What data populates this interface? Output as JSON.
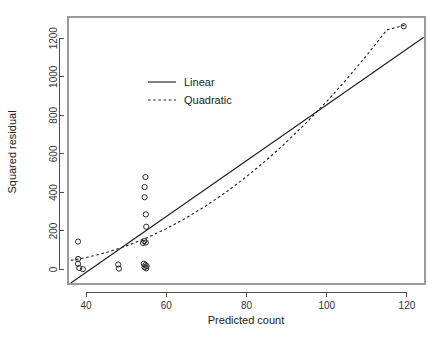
{
  "chart_data": {
    "type": "scatter",
    "title": "",
    "xlabel": "Predicted count",
    "ylabel": "Squared residual",
    "xlim": [
      35.5,
      124.5
    ],
    "ylim": [
      -75,
      1310
    ],
    "grid": false,
    "xticks": [
      40,
      60,
      80,
      100,
      120
    ],
    "yticks": [
      0,
      200,
      400,
      600,
      800,
      1000,
      1200
    ],
    "xtick_labels": [
      "40",
      "60",
      "80",
      "100",
      "120"
    ],
    "ytick_labels": [
      "0",
      "200",
      "400",
      "600",
      "800",
      "1000",
      "1200"
    ],
    "legend_position": "upper-left-inset",
    "point_marker": "open-circle",
    "point_color": "#2b2b2b",
    "line_color": "#1c1c1c",
    "points": [
      {
        "x": 38.0,
        "y": 145
      },
      {
        "x": 38.0,
        "y": 55
      },
      {
        "x": 38.0,
        "y": 30
      },
      {
        "x": 38.3,
        "y": 8
      },
      {
        "x": 39.2,
        "y": 2
      },
      {
        "x": 48.0,
        "y": 26
      },
      {
        "x": 48.2,
        "y": 5
      },
      {
        "x": 54.8,
        "y": 480
      },
      {
        "x": 54.6,
        "y": 428
      },
      {
        "x": 54.6,
        "y": 375
      },
      {
        "x": 54.9,
        "y": 286
      },
      {
        "x": 55.0,
        "y": 222
      },
      {
        "x": 54.5,
        "y": 148
      },
      {
        "x": 54.9,
        "y": 140
      },
      {
        "x": 54.2,
        "y": 138
      },
      {
        "x": 54.4,
        "y": 30
      },
      {
        "x": 54.8,
        "y": 24
      },
      {
        "x": 55.1,
        "y": 18
      },
      {
        "x": 54.6,
        "y": 12
      },
      {
        "x": 55.0,
        "y": 6
      },
      {
        "x": 119.2,
        "y": 1262
      }
    ],
    "series": [
      {
        "name": "Linear",
        "type": "line",
        "style": "solid",
        "model": "y = a + b*x",
        "endpoints": [
          {
            "x": 36.2,
            "y": -70
          },
          {
            "x": 124.2,
            "y": 1205
          }
        ]
      },
      {
        "name": "Quadratic",
        "type": "line",
        "style": "dashed",
        "model": "y = a + b*x + c*x^2",
        "sample_points": [
          {
            "x": 36.2,
            "y": 48
          },
          {
            "x": 40.0,
            "y": 62
          },
          {
            "x": 45.0,
            "y": 88
          },
          {
            "x": 50.0,
            "y": 122
          },
          {
            "x": 55.0,
            "y": 163
          },
          {
            "x": 60.0,
            "y": 212
          },
          {
            "x": 65.0,
            "y": 268
          },
          {
            "x": 70.0,
            "y": 332
          },
          {
            "x": 75.0,
            "y": 403
          },
          {
            "x": 80.0,
            "y": 482
          },
          {
            "x": 85.0,
            "y": 568
          },
          {
            "x": 90.0,
            "y": 662
          },
          {
            "x": 95.0,
            "y": 763
          },
          {
            "x": 100.0,
            "y": 872
          },
          {
            "x": 105.0,
            "y": 988
          },
          {
            "x": 110.0,
            "y": 1112
          },
          {
            "x": 115.0,
            "y": 1243
          },
          {
            "x": 119.5,
            "y": 1268
          }
        ]
      }
    ],
    "legend": [
      {
        "label": "Linear",
        "style": "solid"
      },
      {
        "label": "Quadratic",
        "style": "dashed"
      }
    ]
  }
}
